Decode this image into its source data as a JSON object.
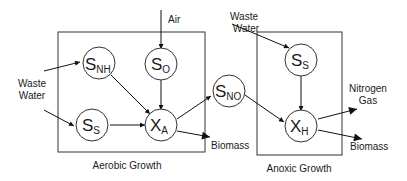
{
  "groups": [
    {
      "id": "aerobic",
      "label": "Aerobic Growth"
    },
    {
      "id": "anoxic",
      "label": "Anoxic Growth"
    }
  ],
  "nodes": [
    {
      "id": "snh",
      "main": "S",
      "sub": "NH"
    },
    {
      "id": "so",
      "main": "S",
      "sub": "O"
    },
    {
      "id": "ss1",
      "main": "S",
      "sub": "S"
    },
    {
      "id": "xa",
      "main": "X",
      "sub": "A"
    },
    {
      "id": "sno",
      "main": "S",
      "sub": "NO"
    },
    {
      "id": "ss2",
      "main": "S",
      "sub": "S"
    },
    {
      "id": "xh",
      "main": "X",
      "sub": "H"
    }
  ],
  "labels": {
    "air": "Air",
    "waste_water_1a": "Waste",
    "waste_water_1b": "Water",
    "waste_water_2a": "Waste",
    "waste_water_2b": "Water",
    "biomass_1": "Biomass",
    "biomass_2": "Biomass",
    "nitrogen_gas_a": "Nitrogen",
    "nitrogen_gas_b": "Gas"
  },
  "edges": [
    {
      "from": "Air",
      "to": "so"
    },
    {
      "from": "Waste Water",
      "to": "snh"
    },
    {
      "from": "Waste Water",
      "to": "ss1"
    },
    {
      "from": "snh",
      "to": "xa"
    },
    {
      "from": "so",
      "to": "xa"
    },
    {
      "from": "ss1",
      "to": "xa"
    },
    {
      "from": "xa",
      "to": "sno"
    },
    {
      "from": "xa",
      "to": "Biomass"
    },
    {
      "from": "Waste Water",
      "to": "ss2"
    },
    {
      "from": "ss2",
      "to": "xh"
    },
    {
      "from": "sno",
      "to": "xh"
    },
    {
      "from": "xh",
      "to": "Nitrogen Gas"
    },
    {
      "from": "xh",
      "to": "Biomass"
    }
  ]
}
